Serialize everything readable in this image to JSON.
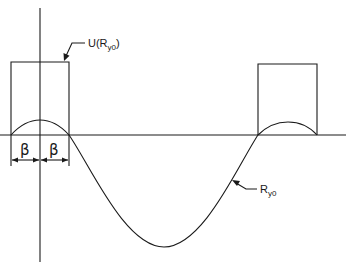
{
  "diagram": {
    "labels": {
      "window_function": "U(R",
      "window_function_sub": "y0",
      "window_function_close": ")",
      "curve": "R",
      "curve_sub": "y0",
      "beta_left": "β",
      "beta_right": "β"
    },
    "elements": {
      "vertical_axis": {
        "x": 40,
        "y_top": 8,
        "y_bottom": 262
      },
      "baseline": {
        "y": 135,
        "x_start": 0,
        "x_end": 346
      },
      "left_window": {
        "x_left": 11,
        "x_right": 69,
        "y_top": 62,
        "y_bottom": 135
      },
      "right_window": {
        "x_left": 258,
        "x_right": 317,
        "y_top": 64,
        "y_bottom": 135
      },
      "curve": {
        "description": "correlation function R_y0, small positive lobes inside windows, large negative lobe between",
        "zero_crossings": [
          11,
          69,
          258,
          317
        ],
        "positive_peaks": [
          {
            "x": 40,
            "y": 120
          },
          {
            "x": 288,
            "y": 122
          }
        ],
        "negative_min": {
          "x": 164,
          "y": 247
        }
      },
      "dimension_arrows_y": 160
    },
    "colors": {
      "line": "#1a1a1a",
      "background": "#ffffff"
    }
  }
}
